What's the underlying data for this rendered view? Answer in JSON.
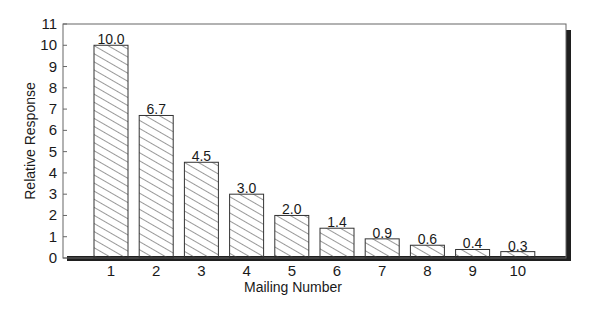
{
  "chart_data": {
    "type": "bar",
    "title": "",
    "xlabel": "Mailing Number",
    "ylabel": "Relative Response",
    "categories": [
      "1",
      "2",
      "3",
      "4",
      "5",
      "6",
      "7",
      "8",
      "9",
      "10"
    ],
    "values": [
      10.0,
      6.7,
      4.5,
      3.0,
      2.0,
      1.4,
      0.9,
      0.6,
      0.4,
      0.3
    ],
    "value_labels": [
      "10.0",
      "6.7",
      "4.5",
      "3.0",
      "2.0",
      "1.4",
      "0.9",
      "0.6",
      "0.4",
      "0.3"
    ],
    "ylim": [
      0,
      11
    ],
    "yticks": [
      0,
      1,
      2,
      3,
      4,
      5,
      6,
      7,
      8,
      9,
      10,
      11
    ],
    "grid": false,
    "legend": null,
    "bar_fill": "diagonal-hatch",
    "colors": {
      "bar_edge": "#333333",
      "hatch": "#444444",
      "frame": "#555555",
      "shadow": "#1f1f1f"
    }
  },
  "axes": {
    "xlabel": "Mailing Number",
    "ylabel": "Relative Response"
  }
}
